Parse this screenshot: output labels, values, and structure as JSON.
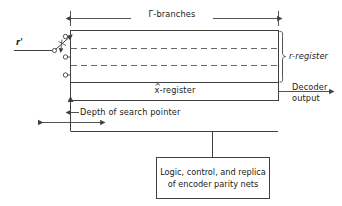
{
  "figure": {
    "title_top": "Γ-branches",
    "input_label": "r'",
    "register_brace_label": "r-register",
    "estimate_register_label": "x̂-register",
    "estimate_register_base": "x",
    "estimate_register_hat": "^",
    "estimate_register_suffix": "-register",
    "decoder_output_line1": "Decoder",
    "decoder_output_line2": "output",
    "depth_pointer_label": "Depth of search pointer",
    "logic_box_line1": "Logic, control, and replica",
    "logic_box_line2": "of encoder parity nets",
    "terminal_count": 3,
    "dashed_row_count": 2
  },
  "colors": {
    "stroke": "#404040",
    "text": "#1a1a1a",
    "background": "#ffffff",
    "dash": "#555555"
  }
}
